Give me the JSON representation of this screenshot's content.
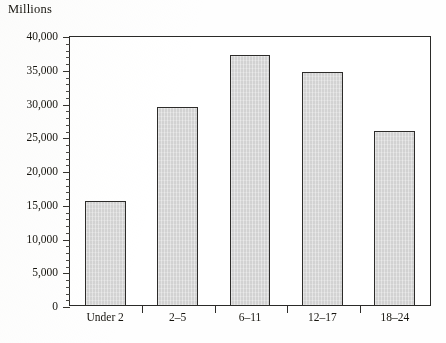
{
  "chart_data": {
    "type": "bar",
    "title": "",
    "ylabel": "Millions",
    "xlabel": "",
    "categories": [
      "Under 2",
      "2–5",
      "6–11",
      "12–17",
      "18–24"
    ],
    "values": [
      15500,
      29500,
      37200,
      34600,
      26000
    ],
    "ylim": [
      0,
      40000
    ],
    "ytick_step": 5000,
    "yminor_step": 1000,
    "ytick_labels": [
      "0",
      "5,000",
      "10,000",
      "15,000",
      "20,000",
      "25,000",
      "30,000",
      "35,000",
      "40,000"
    ],
    "grid": false,
    "legend": false,
    "bar_fill": "#d8d8d8",
    "bar_border": "#2d2c2a",
    "axis_color": "#2a2a28"
  }
}
